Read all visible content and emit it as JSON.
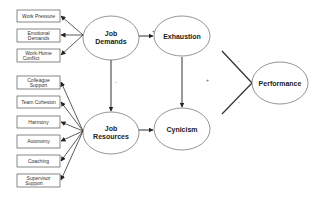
{
  "diagram": {
    "indicators_demands": [
      {
        "id": "work-pressure",
        "lines": [
          "Work Pressure"
        ]
      },
      {
        "id": "emotional-demands",
        "lines": [
          "Emotional",
          "Demands"
        ]
      },
      {
        "id": "work-home-conflict",
        "lines": [
          "Work-Home",
          "Conflict"
        ]
      }
    ],
    "indicators_resources": [
      {
        "id": "colleague-support",
        "lines": [
          "Colleague",
          "Support"
        ]
      },
      {
        "id": "team-cohesion",
        "lines": [
          "Team Cohesion"
        ]
      },
      {
        "id": "harmony",
        "lines": [
          "Harmony"
        ]
      },
      {
        "id": "autonomy",
        "lines": [
          "Autonomy"
        ]
      },
      {
        "id": "coaching",
        "lines": [
          "Coaching"
        ]
      },
      {
        "id": "supervisor-support",
        "lines": [
          "Supervisor",
          "Support"
        ]
      }
    ],
    "constructs": {
      "job_demands": [
        "Job",
        "Demands"
      ],
      "job_resources": [
        "Job",
        "Resources"
      ],
      "exhaustion": "Exhaustion",
      "cynicism": "Cynicism",
      "performance": "Performance"
    },
    "paths": [
      {
        "from": "Job Demands",
        "to": "Exhaustion",
        "sign": "+"
      },
      {
        "from": "Job Resources",
        "to": "Cynicism",
        "sign": "-"
      },
      {
        "from": "Job Demands",
        "to": "Job Resources",
        "sign": "-",
        "bidirectional": true
      },
      {
        "from": "Exhaustion",
        "to": "Cynicism",
        "sign": "+"
      },
      {
        "from": "Exhaustion",
        "to": "Performance",
        "sign": "-"
      },
      {
        "from": "Cynicism",
        "to": "Performance",
        "sign": "-"
      }
    ],
    "signs": {
      "jd_exh": "+",
      "jr_cyn": "-",
      "jd_jr": "-",
      "exh_cyn": "+",
      "exh_perf": "-",
      "cyn_perf": "-"
    },
    "colors": {
      "line": "#333333",
      "box_border": "#555555",
      "ellipse_border": "#666666"
    }
  }
}
